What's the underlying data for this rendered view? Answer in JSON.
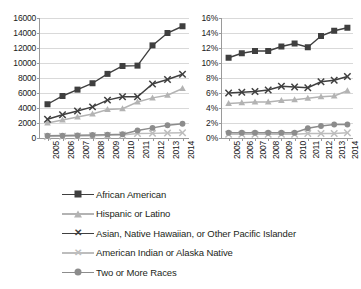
{
  "chart_data": [
    {
      "id": "counts",
      "type": "line",
      "title": "",
      "xlabel": "",
      "ylabel": "",
      "x": [
        "2005",
        "2006",
        "2007",
        "2008",
        "2009",
        "2010",
        "2011",
        "2012",
        "2013",
        "2014"
      ],
      "ylim": [
        0,
        16000
      ],
      "yticks": [
        "0",
        "2000",
        "4000",
        "6000",
        "8000",
        "10000",
        "12000",
        "14000",
        "16000"
      ],
      "ytick_values": [
        0,
        2000,
        4000,
        6000,
        8000,
        10000,
        12000,
        14000,
        16000
      ],
      "grid": true,
      "legend_position": "bottom",
      "series": [
        {
          "name": "African American",
          "marker": "square",
          "color": "#3f3f3f",
          "values": [
            4500,
            5600,
            6450,
            7300,
            8550,
            9600,
            9650,
            12350,
            14000,
            14900
          ]
        },
        {
          "name": "Hispanic or Latino",
          "marker": "triangle",
          "color": "#b3b3b3",
          "values": [
            2000,
            2400,
            2800,
            3200,
            3800,
            3900,
            4800,
            5350,
            5700,
            6600
          ]
        },
        {
          "name": "Asian, Native Hawaiian, or Other Pacific Islander",
          "marker": "x",
          "color": "#3f3f3f",
          "values": [
            2500,
            3100,
            3600,
            4150,
            5050,
            5500,
            5500,
            7200,
            7800,
            8500
          ]
        },
        {
          "name": "American Indian or Alaska Native",
          "marker": "x",
          "color": "#bdbdbd",
          "values": [
            200,
            230,
            260,
            300,
            350,
            400,
            600,
            620,
            660,
            700
          ]
        },
        {
          "name": "Two or More Races",
          "marker": "circle",
          "color": "#8c8c8c",
          "values": [
            300,
            330,
            360,
            400,
            450,
            500,
            1000,
            1350,
            1700,
            1900
          ]
        }
      ]
    },
    {
      "id": "percent",
      "type": "line",
      "title": "",
      "xlabel": "",
      "ylabel": "",
      "x": [
        "2005",
        "2006",
        "2007",
        "2008",
        "2009",
        "2010",
        "2011",
        "2012",
        "2013",
        "2014"
      ],
      "ylim": [
        0,
        16
      ],
      "yticks": [
        "0%",
        "2%",
        "4%",
        "6%",
        "8%",
        "10%",
        "12%",
        "14%",
        "16%"
      ],
      "ytick_values": [
        0,
        2,
        4,
        6,
        8,
        10,
        12,
        14,
        16
      ],
      "grid": true,
      "legend_position": "bottom",
      "series": [
        {
          "name": "African American",
          "marker": "square",
          "color": "#3f3f3f",
          "values": [
            10.7,
            11.3,
            11.6,
            11.6,
            12.2,
            12.6,
            12.1,
            13.6,
            14.3,
            14.7
          ]
        },
        {
          "name": "Hispanic or Latino",
          "marker": "triangle",
          "color": "#b3b3b3",
          "values": [
            4.6,
            4.7,
            4.8,
            4.8,
            5.0,
            5.1,
            5.3,
            5.5,
            5.6,
            6.3
          ]
        },
        {
          "name": "Asian, Native Hawaiian, or Other Pacific Islander",
          "marker": "x",
          "color": "#3f3f3f",
          "values": [
            6.0,
            6.1,
            6.2,
            6.4,
            6.9,
            6.8,
            6.7,
            7.5,
            7.7,
            8.2
          ]
        },
        {
          "name": "American Indian or Alaska Native",
          "marker": "x",
          "color": "#bdbdbd",
          "values": [
            0.5,
            0.5,
            0.5,
            0.5,
            0.5,
            0.5,
            0.6,
            0.6,
            0.6,
            0.7
          ]
        },
        {
          "name": "Two or More Races",
          "marker": "circle",
          "color": "#8c8c8c",
          "values": [
            0.7,
            0.7,
            0.7,
            0.7,
            0.7,
            0.7,
            1.3,
            1.6,
            1.8,
            1.8
          ]
        }
      ]
    }
  ],
  "legend": {
    "items": [
      {
        "label": "African American",
        "marker": "square",
        "color": "#3f3f3f"
      },
      {
        "label": "Hispanic or Latino",
        "marker": "triangle",
        "color": "#b3b3b3"
      },
      {
        "label": "Asian, Native Hawaiian, or Other Pacific Islander",
        "marker": "x",
        "color": "#3f3f3f"
      },
      {
        "label": "American Indian or Alaska Native",
        "marker": "x",
        "color": "#bdbdbd"
      },
      {
        "label": "Two or More Races",
        "marker": "circle",
        "color": "#8c8c8c"
      }
    ]
  }
}
